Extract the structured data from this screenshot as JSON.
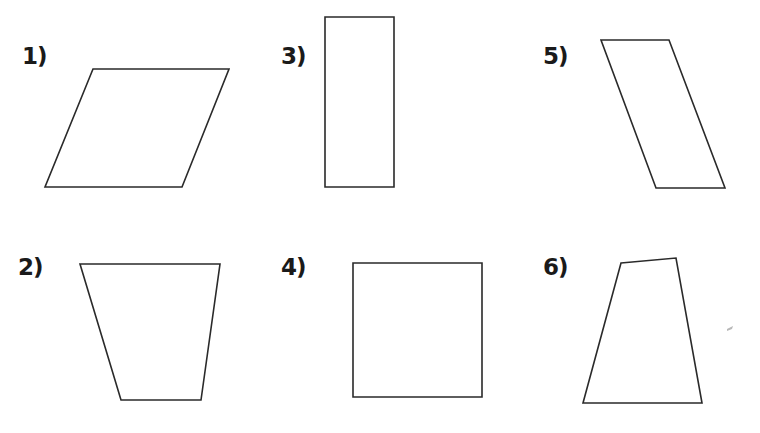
{
  "figures": [
    {
      "label": "1)",
      "shape": "parallelogram",
      "points": [
        [
          93,
          69
        ],
        [
          229,
          69
        ],
        [
          182,
          187
        ],
        [
          45,
          187
        ]
      ],
      "label_pos": [
        22,
        45
      ]
    },
    {
      "label": "2)",
      "shape": "trapezoid",
      "points": [
        [
          80,
          264
        ],
        [
          220,
          264
        ],
        [
          201,
          400
        ],
        [
          121,
          400
        ]
      ],
      "label_pos": [
        18,
        256
      ]
    },
    {
      "label": "3)",
      "shape": "rectangle",
      "points": [
        [
          325,
          17
        ],
        [
          394,
          17
        ],
        [
          394,
          187
        ],
        [
          325,
          187
        ]
      ],
      "label_pos": [
        281,
        45
      ]
    },
    {
      "label": "4)",
      "shape": "square",
      "points": [
        [
          353,
          263
        ],
        [
          482,
          263
        ],
        [
          482,
          397
        ],
        [
          353,
          397
        ]
      ],
      "label_pos": [
        281,
        256
      ]
    },
    {
      "label": "5)",
      "shape": "parallelogram",
      "points": [
        [
          601,
          40
        ],
        [
          669,
          40
        ],
        [
          725,
          188
        ],
        [
          656,
          188
        ]
      ],
      "label_pos": [
        543,
        45
      ]
    },
    {
      "label": "6)",
      "shape": "quadrilateral",
      "points": [
        [
          621,
          263
        ],
        [
          676,
          258
        ],
        [
          702,
          403
        ],
        [
          583,
          403
        ]
      ],
      "label_pos": [
        543,
        256
      ]
    }
  ],
  "style": {
    "stroke": "#2a2a2a",
    "background": "#ffffff"
  }
}
